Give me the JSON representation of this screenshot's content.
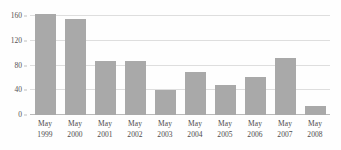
{
  "chart_data": {
    "type": "bar",
    "title": "",
    "subtitle": "",
    "xlabel": "",
    "ylabel": "",
    "categories": [
      "May 1999",
      "May 2000",
      "May 2001",
      "May 2002",
      "May 2003",
      "May 2004",
      "May 2005",
      "May 2006",
      "May 2007",
      "May 2008"
    ],
    "category_lines": [
      [
        "May",
        "1999"
      ],
      [
        "May",
        "2000"
      ],
      [
        "May",
        "2001"
      ],
      [
        "May",
        "2002"
      ],
      [
        "May",
        "2003"
      ],
      [
        "May",
        "2004"
      ],
      [
        "May",
        "2005"
      ],
      [
        "May",
        "2006"
      ],
      [
        "May",
        "2007"
      ],
      [
        "May",
        "2008"
      ]
    ],
    "values": [
      164,
      156,
      88,
      88,
      41,
      70,
      48,
      61,
      93,
      14
    ],
    "ylim": [
      0,
      170
    ],
    "yticks": [
      0,
      40,
      80,
      120,
      160
    ],
    "ytick_labels": [
      "0",
      "40",
      "80",
      "120",
      "160"
    ],
    "grid": true,
    "grid_axis": "y",
    "legend": false,
    "legend_position": "none",
    "bar_color": "#a9a9a9",
    "gridline_color": "#dedede",
    "axis_color": "#b9b9b9",
    "text_color": "#4d4a4b",
    "background_color": "#fefefe"
  }
}
